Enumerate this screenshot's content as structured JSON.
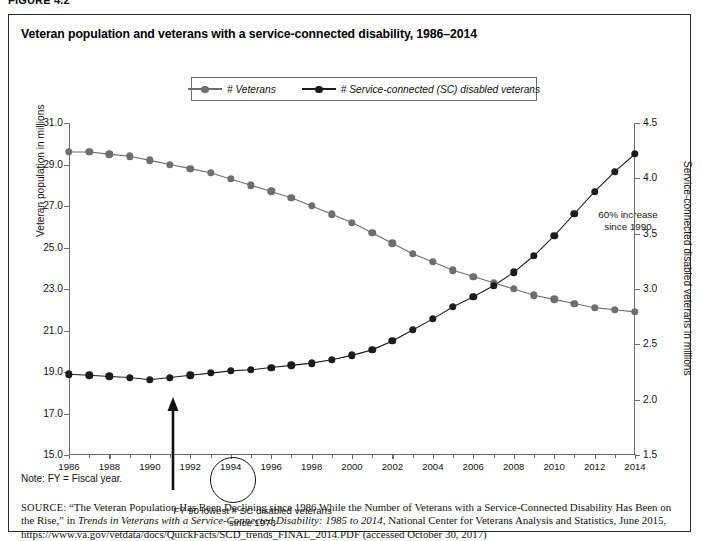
{
  "figure_label": "FIGURE 4.2",
  "chart_title": "Veteran population and veterans with a service-connected disability, 1986–2014",
  "legend": {
    "items": [
      {
        "label": "# Veterans",
        "color": "#6e6e6e"
      },
      {
        "label": "# Service-connected (SC) disabled veterans",
        "color": "#1c1c1c"
      }
    ]
  },
  "annotations": {
    "increase_line1": "60% increase",
    "increase_line2": "since 1990",
    "fy90_line1": "FY 90 lowest # SC disabled veterans",
    "fy90_line2": "since 1973"
  },
  "note": "Note: FY = Fiscal year.",
  "source": {
    "prefix": "SOURCE:",
    "part1": " “The Veteran Population Has Been Declining since 1986 While the Number of Veterans with a Service-Connected Disability Has Been on the Rise,” in ",
    "italic": "Trends in Veterans with a Service-Connected Disability: 1985 to 2014",
    "part2": ", National Center for Veterans Analysis and Statistics, June 2015, https://www.va.gov/vetdata/docs/QuickFacts/SCD_trends_FINAL_2014.PDF (accessed October 30, 2017)"
  },
  "chart_data": {
    "type": "line",
    "title": "Veteran population and veterans with a service-connected disability, 1986–2014",
    "xlabel": "",
    "ylabel": "Veteran population in millions",
    "y2label": "Service-connected disabled veterans in millions",
    "xlim": [
      1986,
      2014
    ],
    "ylim": [
      15.0,
      31.0
    ],
    "y2lim": [
      1.5,
      4.5
    ],
    "ytick_labels": [
      "15.0",
      "17.0",
      "19.0",
      "21.0",
      "23.0",
      "25.0",
      "27.0",
      "29.0",
      "31.0"
    ],
    "ytick_values": [
      15.0,
      17.0,
      19.0,
      21.0,
      23.0,
      25.0,
      27.0,
      29.0,
      31.0
    ],
    "y2tick_labels": [
      "1.5",
      "2.0",
      "2.5",
      "3.0",
      "3.5",
      "4.0",
      "4.5"
    ],
    "y2tick_values": [
      1.5,
      2.0,
      2.5,
      3.0,
      3.5,
      4.0,
      4.5
    ],
    "xtick_labels": [
      "1986",
      "1988",
      "1990",
      "1992",
      "1994",
      "1996",
      "1998",
      "2000",
      "2002",
      "2004",
      "2006",
      "2008",
      "2010",
      "2012",
      "2014"
    ],
    "xtick_values": [
      1986,
      1988,
      1990,
      1992,
      1994,
      1996,
      1998,
      2000,
      2002,
      2004,
      2006,
      2008,
      2010,
      2012,
      2014
    ],
    "x": [
      1986,
      1987,
      1988,
      1989,
      1990,
      1991,
      1992,
      1993,
      1994,
      1995,
      1996,
      1997,
      1998,
      1999,
      2000,
      2001,
      2002,
      2003,
      2004,
      2005,
      2006,
      2007,
      2008,
      2009,
      2010,
      2011,
      2012,
      2013,
      2014
    ],
    "grid": false,
    "legend_position": "top-center",
    "series": [
      {
        "name": "# Veterans",
        "axis": "left",
        "units": "millions",
        "color": "#6e6e6e",
        "values": [
          29.6,
          29.6,
          29.5,
          29.4,
          29.2,
          29.0,
          28.8,
          28.6,
          28.3,
          28.0,
          27.7,
          27.4,
          27.0,
          26.6,
          26.2,
          25.7,
          25.2,
          24.7,
          24.3,
          23.9,
          23.6,
          23.3,
          23.0,
          22.7,
          22.5,
          22.3,
          22.1,
          22.0,
          21.9
        ]
      },
      {
        "name": "# Service-connected (SC) disabled veterans",
        "axis": "right",
        "units": "millions",
        "color": "#1c1c1c",
        "values": [
          2.23,
          2.22,
          2.21,
          2.2,
          2.18,
          2.2,
          2.22,
          2.24,
          2.26,
          2.27,
          2.29,
          2.31,
          2.33,
          2.36,
          2.4,
          2.45,
          2.53,
          2.63,
          2.73,
          2.84,
          2.93,
          3.03,
          3.15,
          3.3,
          3.48,
          3.68,
          3.88,
          4.06,
          4.22
        ]
      }
    ]
  }
}
